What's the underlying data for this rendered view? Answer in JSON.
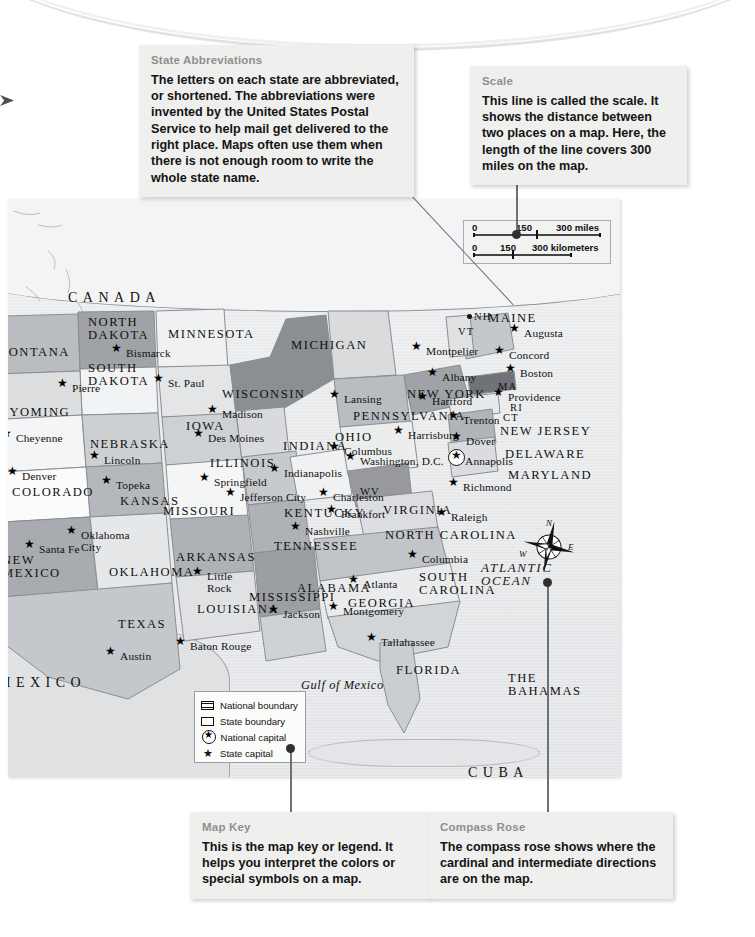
{
  "page": {
    "type": "textbook-map-figure"
  },
  "callouts": [
    {
      "id": "state-abbreviations",
      "title": "State Abbreviations",
      "body": "The letters on each state are abbreviated, or shortened. The abbreviations were invented by the United States Postal Service to help mail get delivered to the right place. Maps often use them when there is not enough room to write the whole state name."
    },
    {
      "id": "scale",
      "title": "Scale",
      "body": "This line is called the scale. It shows the distance between two places on a map. Here, the length of the line covers 300 miles on the map."
    },
    {
      "id": "map-key",
      "title": "Map Key",
      "body": "This is the map key or legend. It helps you interpret the colors or special symbols on a map."
    },
    {
      "id": "compass-rose",
      "title": "Compass Rose",
      "body": "The compass rose shows where the cardinal and intermediate directions are on the map."
    }
  ],
  "scalebar": {
    "miles": {
      "start": "0",
      "mid": "150",
      "end": "300 miles"
    },
    "kilometers": {
      "start": "0",
      "mid": "150",
      "end": "300 kilometers"
    }
  },
  "map_key": {
    "items": [
      {
        "symbol": "national-boundary-swatch",
        "label": "National boundary"
      },
      {
        "symbol": "state-boundary-swatch",
        "label": "State boundary"
      },
      {
        "symbol": "national-capital-star-circle",
        "label": "National capital"
      },
      {
        "symbol": "state-capital-star",
        "label": "State capital"
      }
    ]
  },
  "compass": {
    "n": "N",
    "e": "E",
    "s": "S",
    "w": "W"
  },
  "map": {
    "countries": [
      {
        "name": "CANADA",
        "x": 60,
        "y": 92
      },
      {
        "name": "MEXICO",
        "x": -10,
        "y": 477
      },
      {
        "name": "CUBA",
        "x": 460,
        "y": 567
      }
    ],
    "regions": [
      {
        "name": "THE\nBAHAMAS",
        "x": 500,
        "y": 473
      }
    ],
    "waters": [
      {
        "name": "ATLANTIC\nOCEAN",
        "x": 473,
        "y": 362
      },
      {
        "name": "Gulf of Mexico",
        "x": 293,
        "y": 480
      }
    ],
    "states": [
      {
        "name": "MONTANA",
        "abbr": "",
        "x": -12,
        "y": 147
      },
      {
        "name": "NORTH\nDAKOTA",
        "x": 80,
        "y": 117
      },
      {
        "name": "SOUTH\nDAKOTA",
        "x": 80,
        "y": 163
      },
      {
        "name": "WYOMING",
        "x": -12,
        "y": 207
      },
      {
        "name": "COLORADO",
        "x": 4,
        "y": 287
      },
      {
        "name": "NEBRASKA",
        "x": 82,
        "y": 239
      },
      {
        "name": "KANSAS",
        "x": 112,
        "y": 296
      },
      {
        "name": "MINNESOTA",
        "x": 160,
        "y": 129
      },
      {
        "name": "IOWA",
        "x": 178,
        "y": 221
      },
      {
        "name": "MISSOURI",
        "x": 155,
        "y": 306
      },
      {
        "name": "OKLAHOMA",
        "x": 101,
        "y": 367
      },
      {
        "name": "NEW\nMEXICO",
        "x": -6,
        "y": 355
      },
      {
        "name": "TEXAS",
        "x": 110,
        "y": 419
      },
      {
        "name": "ARKANSAS",
        "x": 168,
        "y": 352
      },
      {
        "name": "LOUISIANA",
        "x": 189,
        "y": 404
      },
      {
        "name": "MISSISSIPPI",
        "x": 241,
        "y": 392
      },
      {
        "name": "ALABAMA",
        "x": 289,
        "y": 383
      },
      {
        "name": "GEORGIA",
        "x": 340,
        "y": 398
      },
      {
        "name": "FLORIDA",
        "x": 388,
        "y": 465
      },
      {
        "name": "TENNESSEE",
        "x": 266,
        "y": 341
      },
      {
        "name": "KENTUCKY",
        "x": 276,
        "y": 308
      },
      {
        "name": "WISCONSIN",
        "x": 214,
        "y": 189
      },
      {
        "name": "MICHIGAN",
        "x": 283,
        "y": 140
      },
      {
        "name": "ILLINOIS",
        "x": 202,
        "y": 258
      },
      {
        "name": "INDIANA",
        "x": 275,
        "y": 241
      },
      {
        "name": "OHIO",
        "x": 327,
        "y": 232
      },
      {
        "name": "WV",
        "x": 352,
        "y": 288
      },
      {
        "name": "VIRGINIA",
        "x": 375,
        "y": 305
      },
      {
        "name": "NORTH CAROLINA",
        "x": 377,
        "y": 330
      },
      {
        "name": "SOUTH\nCAROLINA",
        "x": 411,
        "y": 372
      },
      {
        "name": "PENNSYLVANIA",
        "x": 345,
        "y": 211
      },
      {
        "name": "NEW YORK",
        "x": 399,
        "y": 189
      },
      {
        "name": "MAINE",
        "x": 480,
        "y": 113
      },
      {
        "name": "NH",
        "x": 466,
        "y": 113
      },
      {
        "name": "VT",
        "x": 450,
        "y": 128
      },
      {
        "name": "MA",
        "x": 490,
        "y": 183
      },
      {
        "name": "RI",
        "x": 502,
        "y": 204
      },
      {
        "name": "CT",
        "x": 495,
        "y": 214
      },
      {
        "name": "NEW JERSEY",
        "x": 492,
        "y": 226
      },
      {
        "name": "DELAWARE",
        "x": 497,
        "y": 249
      },
      {
        "name": "MARYLAND",
        "x": 500,
        "y": 270
      }
    ],
    "capitals": [
      {
        "name": "Bismarck",
        "x": 118,
        "y": 149
      },
      {
        "name": "Pierre",
        "x": 64,
        "y": 184
      },
      {
        "name": "Cheyenne",
        "x": 8,
        "y": 234
      },
      {
        "name": "Denver",
        "x": 14,
        "y": 272
      },
      {
        "name": "Lincoln",
        "x": 96,
        "y": 256
      },
      {
        "name": "Topeka",
        "x": 108,
        "y": 281
      },
      {
        "name": "Santa Fe",
        "x": 31,
        "y": 345
      },
      {
        "name": "Oklahoma\nCity",
        "x": 73,
        "y": 331
      },
      {
        "name": "Austin",
        "x": 112,
        "y": 452
      },
      {
        "name": "Baton Rouge",
        "x": 182,
        "y": 442
      },
      {
        "name": "Little\nRock",
        "x": 199,
        "y": 372
      },
      {
        "name": "Jackson",
        "x": 275,
        "y": 410
      },
      {
        "name": "Montgomery",
        "x": 335,
        "y": 407
      },
      {
        "name": "Atlanta",
        "x": 355,
        "y": 380
      },
      {
        "name": "Tallahassee",
        "x": 373,
        "y": 438
      },
      {
        "name": "Columbia",
        "x": 414,
        "y": 355
      },
      {
        "name": "Raleigh",
        "x": 443,
        "y": 313
      },
      {
        "name": "Nashville",
        "x": 297,
        "y": 327
      },
      {
        "name": "Frankfort",
        "x": 333,
        "y": 310
      },
      {
        "name": "Charleston",
        "x": 325,
        "y": 293
      },
      {
        "name": "Richmond",
        "x": 455,
        "y": 283
      },
      {
        "name": "Annapolis",
        "x": 457,
        "y": 257
      },
      {
        "name": "Washington, D.C.",
        "x": 352,
        "y": 257
      },
      {
        "name": "Columbus",
        "x": 336,
        "y": 247
      },
      {
        "name": "Indianapolis",
        "x": 276,
        "y": 269
      },
      {
        "name": "Springfield",
        "x": 206,
        "y": 278
      },
      {
        "name": "Jefferson City",
        "x": 232,
        "y": 293
      },
      {
        "name": "Des Moines",
        "x": 200,
        "y": 234
      },
      {
        "name": "Madison",
        "x": 214,
        "y": 210
      },
      {
        "name": "St. Paul",
        "x": 160,
        "y": 179
      },
      {
        "name": "Lansing",
        "x": 336,
        "y": 195
      },
      {
        "name": "Harrisburg",
        "x": 400,
        "y": 231
      },
      {
        "name": "Dover",
        "x": 458,
        "y": 237
      },
      {
        "name": "Trenton",
        "x": 455,
        "y": 216
      },
      {
        "name": "Albany",
        "x": 434,
        "y": 173
      },
      {
        "name": "Hartford",
        "x": 424,
        "y": 197
      },
      {
        "name": "Providence",
        "x": 500,
        "y": 193
      },
      {
        "name": "Boston",
        "x": 512,
        "y": 169
      },
      {
        "name": "Concord",
        "x": 501,
        "y": 151
      },
      {
        "name": "Augusta",
        "x": 516,
        "y": 129
      },
      {
        "name": "Montpelier",
        "x": 418,
        "y": 147
      }
    ]
  }
}
